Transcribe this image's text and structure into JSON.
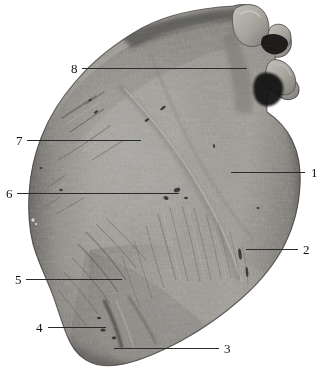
{
  "figure": {
    "kind": "anatomical-specimen-photograph",
    "palette": {
      "background": "#ffffff",
      "bone_light": "#b9b6b0",
      "bone_mid": "#8f8d88",
      "bone_dark": "#5f5e5a",
      "shadow": "#2a2a28",
      "leader_line": "#2b2b2b",
      "label_text": "#111111"
    }
  },
  "labels": [
    {
      "id": "label-1",
      "text": "1",
      "x": 311,
      "y": 166,
      "line": {
        "x1": 231,
        "y1": 172,
        "x2": 305,
        "y2": 172
      }
    },
    {
      "id": "label-2",
      "text": "2",
      "x": 303,
      "y": 243,
      "line": {
        "x1": 246,
        "y1": 249,
        "x2": 298,
        "y2": 249
      }
    },
    {
      "id": "label-3",
      "text": "3",
      "x": 224,
      "y": 342,
      "line": {
        "x1": 114,
        "y1": 348,
        "x2": 219,
        "y2": 348
      }
    },
    {
      "id": "label-4",
      "text": "4",
      "x": 36,
      "y": 321,
      "line": {
        "x1": 48,
        "y1": 327,
        "x2": 106,
        "y2": 327
      }
    },
    {
      "id": "label-5",
      "text": "5",
      "x": 15,
      "y": 273,
      "line": {
        "x1": 26,
        "y1": 279,
        "x2": 122,
        "y2": 279
      }
    },
    {
      "id": "label-6",
      "text": "6",
      "x": 6,
      "y": 187,
      "line": {
        "x1": 17,
        "y1": 193,
        "x2": 179,
        "y2": 193
      }
    },
    {
      "id": "label-7",
      "text": "7",
      "x": 16,
      "y": 134,
      "line": {
        "x1": 27,
        "y1": 140,
        "x2": 141,
        "y2": 140
      }
    },
    {
      "id": "label-8",
      "text": "8",
      "x": 71,
      "y": 62,
      "line": {
        "x1": 82,
        "y1": 68,
        "x2": 247,
        "y2": 68
      }
    }
  ]
}
